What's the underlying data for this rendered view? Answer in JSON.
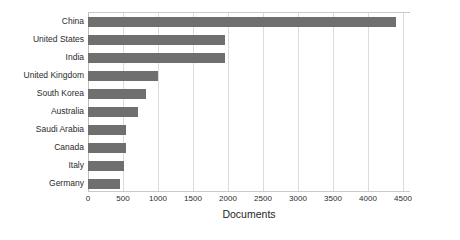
{
  "chart_data": {
    "type": "bar",
    "orientation": "horizontal",
    "title": "",
    "xlabel": "Documents",
    "ylabel": "",
    "categories": [
      "China",
      "United States",
      "India",
      "United Kingdom",
      "South Korea",
      "Australia",
      "Saudi Arabia",
      "Canada",
      "Italy",
      "Germany"
    ],
    "values": [
      4400,
      1950,
      1950,
      1000,
      830,
      720,
      545,
      540,
      515,
      450
    ],
    "xlim": [
      0,
      4600
    ],
    "xticks": [
      0,
      500,
      1000,
      1500,
      2000,
      2500,
      3000,
      3500,
      4000,
      4500
    ],
    "xtick_labels": [
      "0",
      "500",
      "1000",
      "1500",
      "2000",
      "2500",
      "3000",
      "3500",
      "4000",
      "4500"
    ],
    "grid": true,
    "grid_axis": "x",
    "legend": false,
    "bar_color": "#6f6f6f",
    "grid_color": "#dcdcdc",
    "background_color": "#ffffff",
    "text_color": "#2b2b2b"
  }
}
